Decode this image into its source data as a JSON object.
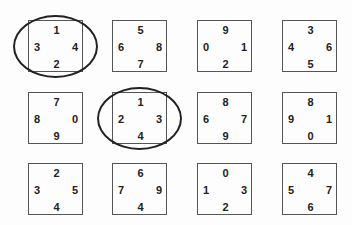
{
  "puzzle": {
    "rows": [
      [
        {
          "top": "1",
          "left": "3",
          "right": "4",
          "bottom": "2",
          "circled": true
        },
        {
          "top": "5",
          "left": "6",
          "right": "8",
          "bottom": "7",
          "circled": false
        },
        {
          "top": "9",
          "left": "0",
          "right": "1",
          "bottom": "2",
          "circled": false
        },
        {
          "top": "3",
          "left": "4",
          "right": "6",
          "bottom": "5",
          "circled": false
        }
      ],
      [
        {
          "top": "7",
          "left": "8",
          "right": "0",
          "bottom": "9",
          "circled": false
        },
        {
          "top": "1",
          "left": "2",
          "right": "3",
          "bottom": "4",
          "circled": true
        },
        {
          "top": "8",
          "left": "6",
          "right": "7",
          "bottom": "9",
          "circled": false
        },
        {
          "top": "8",
          "left": "9",
          "right": "1",
          "bottom": "0",
          "circled": false
        }
      ],
      [
        {
          "top": "2",
          "left": "3",
          "right": "5",
          "bottom": "4",
          "circled": false
        },
        {
          "top": "6",
          "left": "7",
          "right": "9",
          "bottom": "4",
          "circled": false
        },
        {
          "top": "0",
          "left": "1",
          "right": "3",
          "bottom": "2",
          "circled": false
        },
        {
          "top": "4",
          "left": "5",
          "right": "7",
          "bottom": "6",
          "circled": false
        }
      ]
    ]
  }
}
